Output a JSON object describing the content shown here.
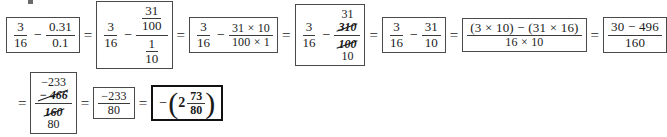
{
  "document": {
    "type": "math-worksheet-solution",
    "description": "Step-by-step simplification of 3/16 minus 0.31/0.1"
  },
  "symbols": {
    "equals": "=",
    "minus": "−",
    "paren_open": "(",
    "paren_close": ")"
  },
  "steps": {
    "step1": {
      "left": {
        "num": "3",
        "den": "16"
      },
      "op": "−",
      "right": {
        "num": "0.31",
        "den": "0.1"
      }
    },
    "step2": {
      "left": {
        "num": "3",
        "den": "16"
      },
      "op": "−",
      "right": {
        "num": {
          "num": "31",
          "den": "100"
        },
        "den": {
          "num": "1",
          "den": "10"
        }
      }
    },
    "step3": {
      "left": {
        "num": "3",
        "den": "16"
      },
      "op": "−",
      "right": {
        "num": "31 × 10",
        "den": "100 × 1"
      }
    },
    "step4": {
      "left": {
        "num": "3",
        "den": "16"
      },
      "op": "−",
      "right": {
        "num_replacement": "31",
        "num_cancelled": "310",
        "den_cancelled": "100",
        "den_replacement": "10"
      }
    },
    "step5": {
      "left": {
        "num": "3",
        "den": "16"
      },
      "op": "−",
      "right": {
        "num": "31",
        "den": "10"
      }
    },
    "step6": {
      "num": "(3 × 10) − (31 × 16)",
      "den": "16 × 10"
    },
    "step7": {
      "num": "30 − 496",
      "den": "160"
    },
    "step8": {
      "num_replacement": "−233",
      "num_cancelled": "− 466",
      "den_cancelled": "160",
      "den_replacement": "80"
    },
    "step9": {
      "num": "−233",
      "den": "80"
    },
    "answer": {
      "sign": "−",
      "whole": "2",
      "num": "73",
      "den": "80"
    }
  }
}
